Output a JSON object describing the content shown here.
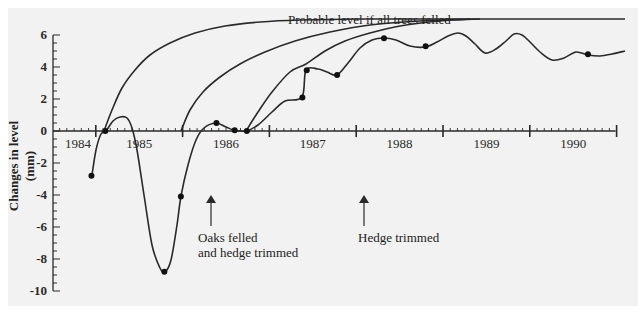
{
  "chart_data": {
    "type": "line",
    "title": "",
    "xlabel": "",
    "ylabel": "Changes in level (mm)",
    "xlim": [
      1984,
      1991
    ],
    "ylim": [
      -10,
      6
    ],
    "x_tick_labels": [
      "1984",
      "1985",
      "1986",
      "1987",
      "1988",
      "1989",
      "1990"
    ],
    "y_tick_labels": [
      "6",
      "4",
      "2",
      "0",
      "-2",
      "-4",
      "-6",
      "-8",
      "-10"
    ],
    "grid": false,
    "series": [
      {
        "name": "Observed level",
        "markers": true,
        "x": [
          1984.95,
          1985.11,
          1985.79,
          1985.98,
          1986.39,
          1986.6,
          1986.74,
          1987.38,
          1987.43,
          1987.78,
          1988.32,
          1988.8,
          1990.67
        ],
        "y": [
          -2.8,
          0.0,
          -8.8,
          -4.1,
          0.5,
          0.05,
          0.0,
          2.1,
          3.8,
          3.5,
          5.8,
          5.3,
          4.8
        ]
      },
      {
        "name": "Probable level if all trees felled",
        "markers": false,
        "x": [
          1985.11,
          1985.5,
          1986.0,
          1986.5,
          1987.0,
          1987.5,
          1988.0,
          1991.0
        ],
        "y": [
          0.0,
          3.2,
          4.9,
          5.8,
          6.3,
          6.5,
          6.6,
          6.6
        ]
      },
      {
        "name": "Recovery curve after oaks felled",
        "markers": false,
        "x": [
          1985.98,
          1986.3,
          1986.8,
          1987.3,
          1987.8,
          1988.3,
          1989.0
        ],
        "y": [
          0.0,
          2.0,
          3.9,
          5.0,
          5.8,
          6.3,
          6.6
        ]
      },
      {
        "name": "Recovery curve after hedge trimmed",
        "markers": false,
        "x": [
          1986.74,
          1987.0,
          1987.5,
          1988.0,
          1988.5,
          1989.0
        ],
        "y": [
          0.0,
          2.8,
          4.8,
          5.8,
          6.3,
          6.6
        ]
      }
    ],
    "annotations": [
      {
        "text": "Probable level if all trees felled",
        "x": 1987.6,
        "y": 6.9
      },
      {
        "text": "Oaks felled\nand hedge trimmed",
        "x": 1986.05,
        "y": -3.5,
        "arrow": true
      },
      {
        "text": "Hedge trimmed",
        "x": 1987.75,
        "y": -3.5,
        "arrow": true
      }
    ]
  },
  "labels": {
    "ylabel": "Changes in level (mm)",
    "curve_label": "Probable level if all trees felled",
    "ann1_line1": "Oaks felled",
    "ann1_line2": "and hedge trimmed",
    "ann2": "Hedge trimmed"
  }
}
